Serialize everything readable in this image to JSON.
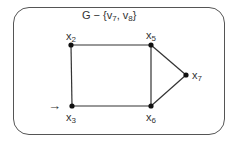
{
  "diagram": {
    "title": {
      "prefix": "G − {",
      "items": [
        {
          "base": "v",
          "sub": "7"
        },
        {
          "base": "v",
          "sub": "8"
        }
      ],
      "separator": ", ",
      "suffix": "}"
    },
    "nodes": [
      {
        "id": "x2",
        "base": "x",
        "sub": "2",
        "x": 71,
        "y": 45
      },
      {
        "id": "x5",
        "base": "x",
        "sub": "5",
        "x": 151,
        "y": 45
      },
      {
        "id": "x7",
        "base": "x",
        "sub": "7",
        "x": 186,
        "y": 75
      },
      {
        "id": "x3",
        "base": "x",
        "sub": "3",
        "x": 72,
        "y": 106
      },
      {
        "id": "x6",
        "base": "x",
        "sub": "6",
        "x": 151,
        "y": 106
      }
    ],
    "edges": [
      [
        "x2",
        "x5"
      ],
      [
        "x2",
        "x3"
      ],
      [
        "x5",
        "x6"
      ],
      [
        "x3",
        "x6"
      ],
      [
        "x5",
        "x7"
      ],
      [
        "x6",
        "x7"
      ]
    ],
    "start_arrow": {
      "glyph": "→",
      "target": "x3"
    },
    "colors": {
      "line": "#333333",
      "node": "#111111",
      "border": "#555555"
    }
  }
}
